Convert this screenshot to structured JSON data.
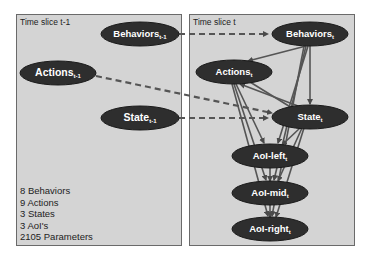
{
  "panels": {
    "left": {
      "title": "Time slice t-1"
    },
    "right": {
      "title": "Time slice t"
    }
  },
  "stats": [
    "8 Behaviors",
    "9 Actions",
    "3 States",
    "3 AoI's",
    "2105 Parameters"
  ],
  "nodes": {
    "behaviors_prev": {
      "label": "Behaviors",
      "sub": "t-1"
    },
    "actions_prev": {
      "label": "Actions",
      "sub": "t-1"
    },
    "state_prev": {
      "label": "State",
      "sub": "t-1"
    },
    "behaviors_t": {
      "label": "Behaviors",
      "sub": "t"
    },
    "actions_t": {
      "label": "Actions",
      "sub": "t"
    },
    "state_t": {
      "label": "State",
      "sub": "t"
    },
    "aoi_left_t": {
      "label": "AoI-left",
      "sub": "t"
    },
    "aoi_mid_t": {
      "label": "AoI-mid",
      "sub": "t"
    },
    "aoi_right_t": {
      "label": "AoI-right",
      "sub": "t"
    }
  },
  "colors": {
    "panel_bg": "#d4d4d4",
    "node_fill": "#2e2e2e",
    "edge": "#505050"
  }
}
